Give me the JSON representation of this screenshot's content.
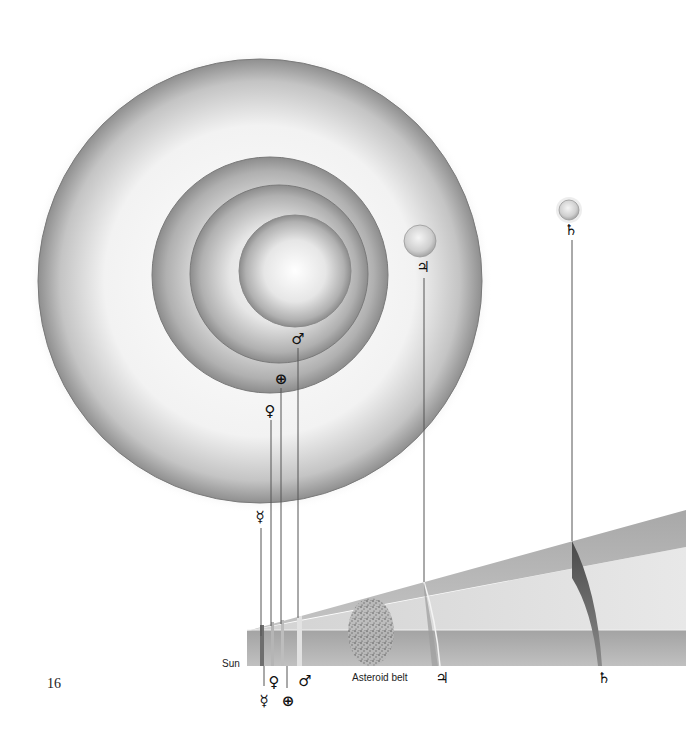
{
  "page": {
    "number": "16"
  },
  "bodies": {
    "sun": {
      "label": "Sun"
    },
    "mercury": {
      "symbol": "☿"
    },
    "venus": {
      "symbol": "♀"
    },
    "earth": {
      "symbol": "⊕"
    },
    "mars": {
      "symbol": "♂"
    },
    "jupiter": {
      "symbol": "♃"
    },
    "saturn": {
      "symbol": "♄"
    }
  },
  "asteroid_belt": {
    "label": "Asteroid belt"
  },
  "colors": {
    "sphere_light": "#ffffff",
    "sphere_dark": "#8a8a8a",
    "band_dark": "#9a9a9a",
    "band_light": "#d6d6d6",
    "line": "#555555"
  }
}
